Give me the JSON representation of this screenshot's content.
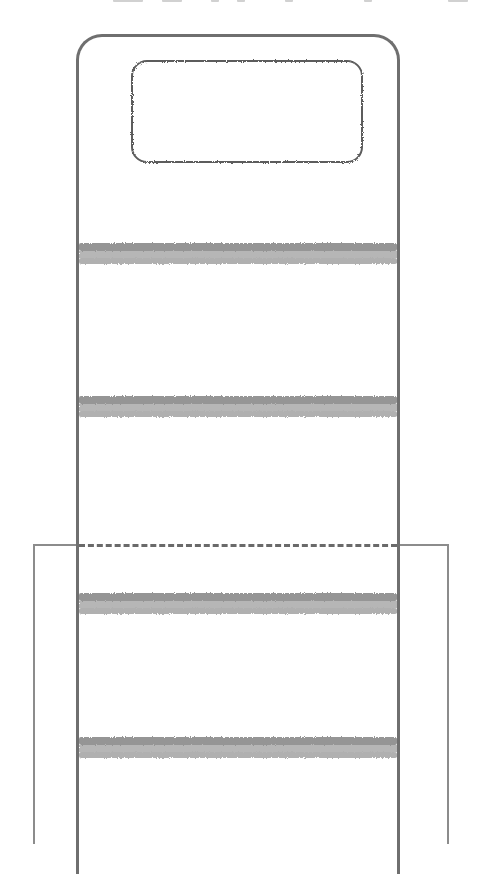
{
  "diagram": {
    "colors": {
      "outline": "#6f6f6f",
      "window": "#5c5c5c",
      "shelf": "#8a8a8a",
      "overlay": "#8c8c8c",
      "background": "#ffffff"
    },
    "container": {
      "label": ""
    },
    "window": {
      "label": ""
    },
    "shelves": [
      {
        "y": 243
      },
      {
        "y": 396
      },
      {
        "y": 593
      },
      {
        "y": 737
      }
    ],
    "overlay": {
      "top_edge": "dashed"
    }
  }
}
